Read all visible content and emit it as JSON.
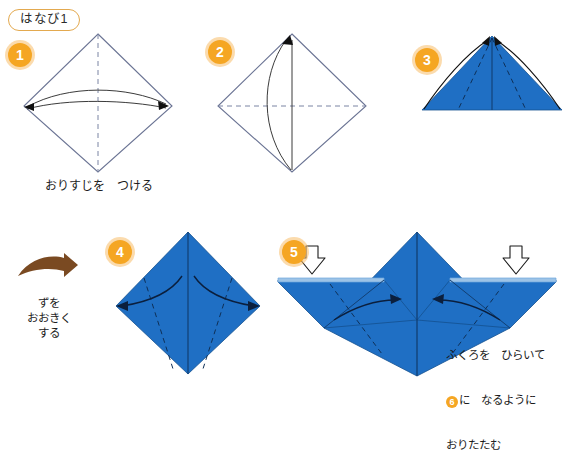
{
  "title": "はなび1",
  "steps": [
    {
      "number": "1",
      "badge_label": "1"
    },
    {
      "number": "2",
      "badge_label": "2"
    },
    {
      "number": "3",
      "badge_label": "3"
    },
    {
      "number": "4",
      "badge_label": "4"
    },
    {
      "number": "5",
      "badge_label": "5"
    }
  ],
  "captions": {
    "step1": "おりすじを　つける",
    "enlarge_line1": "ずを",
    "enlarge_line2": "おおきく",
    "enlarge_line3": "する",
    "step5_line1": "ふくろを　ひらいて",
    "step5_line2_badge": "6",
    "step5_line2_rest": "に　なるように",
    "step5_line3": "おりたたむ"
  },
  "colors": {
    "paper_blue": "#1f6fc4",
    "paper_blue_dark": "#1a56a0",
    "paper_blue_light": "#6ea7dc",
    "badge_orange": "#f5a623",
    "badge_halo": "#f7be69",
    "title_border": "#e3a94f",
    "outline_gray": "#6b7494",
    "brown_arrow": "#7a4a22",
    "arrow_black": "#101010"
  },
  "icons": {
    "push_arrow": "white-hollow-down-arrow",
    "enlarge_arrow": "brown-curved-right-arrow",
    "fold_arrow": "curved-black-arrow"
  }
}
